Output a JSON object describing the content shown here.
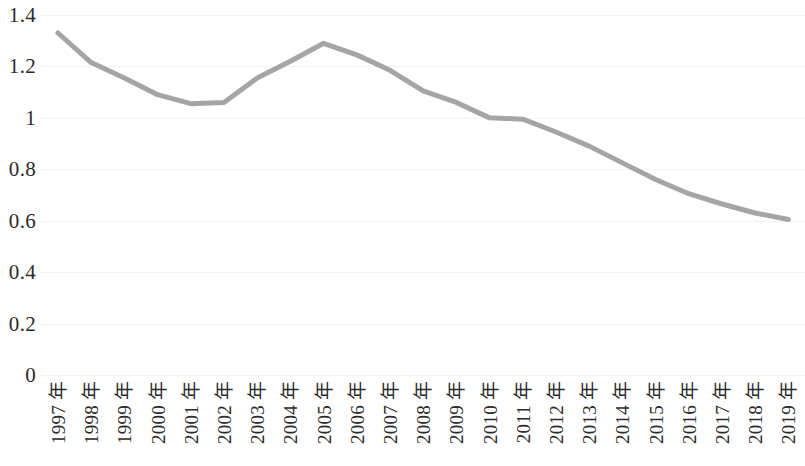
{
  "chart_data": {
    "type": "line",
    "title": "",
    "subtitle": "",
    "xlabel": "",
    "ylabel": "",
    "categories": [
      "1997 年",
      "1998 年",
      "1999 年",
      "2000 年",
      "2001 年",
      "2002 年",
      "2003 年",
      "2004 年",
      "2005 年",
      "2006 年",
      "2007 年",
      "2008 年",
      "2009 年",
      "2010 年",
      "2011 年",
      "2012 年",
      "2013 年",
      "2014 年",
      "2015 年",
      "2016 年",
      "2017 年",
      "2018 年",
      "2019 年"
    ],
    "values": [
      1.33,
      1.215,
      1.155,
      1.09,
      1.055,
      1.06,
      1.155,
      1.22,
      1.29,
      1.245,
      1.185,
      1.105,
      1.06,
      1.0,
      0.995,
      0.945,
      0.89,
      0.825,
      0.76,
      0.705,
      0.665,
      0.63,
      0.605
    ],
    "ylim": [
      0,
      1.4
    ],
    "y_ticks": [
      0,
      0.2,
      0.4,
      0.6,
      0.8,
      1.0,
      1.2,
      1.4
    ],
    "y_tick_labels": [
      "0",
      "0.2",
      "0.4",
      "0.6",
      "0.8",
      "1",
      "1.2",
      "1.4"
    ],
    "grid": true,
    "legend": false,
    "legend_position": "none",
    "series": [
      {
        "name": "",
        "color": "#a5a5a5",
        "line_width": 5,
        "markers": false,
        "values": [
          1.33,
          1.215,
          1.155,
          1.09,
          1.055,
          1.06,
          1.155,
          1.22,
          1.29,
          1.245,
          1.185,
          1.105,
          1.06,
          1.0,
          0.995,
          0.945,
          0.89,
          0.825,
          0.76,
          0.705,
          0.665,
          0.63,
          0.605
        ]
      }
    ],
    "colors": {
      "series_line": "#a5a5a5",
      "gridline": "#f2f2f2",
      "tick_text": "#2b2b2b",
      "background": "#ffffff"
    }
  }
}
